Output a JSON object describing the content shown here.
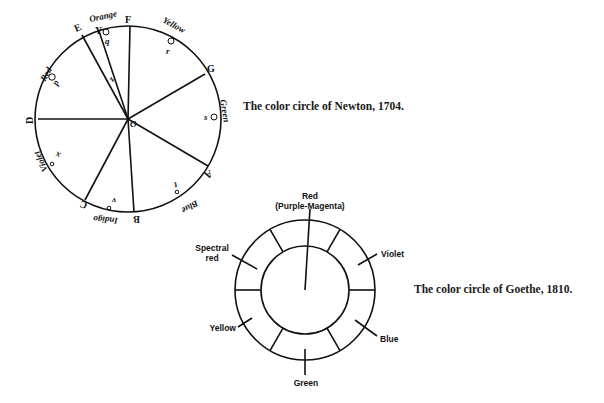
{
  "newton": {
    "caption": "The color circle of Newton, 1704.",
    "letters": {
      "F": "F",
      "G": "G",
      "A": "A",
      "B": "B",
      "C": "C",
      "D": "D",
      "E": "E",
      "Y": "Y",
      "O": "O"
    },
    "colors": {
      "orange": "Orange",
      "yellow": "Yellow",
      "green": "Green",
      "blue": "Blue",
      "indigo": "Indigo",
      "violet": "Violet",
      "red": "Red"
    },
    "points": {
      "p": "p",
      "q": "q",
      "r": "r",
      "s": "s",
      "t": "t",
      "v": "v",
      "x": "x",
      "z": "z"
    }
  },
  "goethe": {
    "caption": "The color circle of Goethe, 1810.",
    "labels": {
      "red_line1": "Red",
      "red_line2": "(Purple-Magenta)",
      "violet": "Violet",
      "blue": "Blue",
      "green": "Green",
      "yellow": "Yellow",
      "spectral_line1": "Spectral",
      "spectral_line2": "red"
    }
  }
}
